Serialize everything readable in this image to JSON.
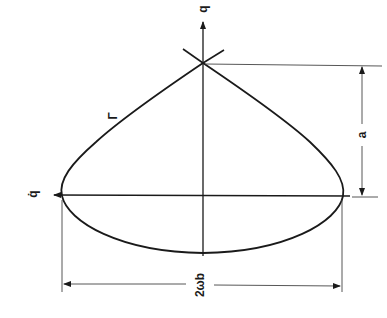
{
  "diagram": {
    "type": "phase-plane trajectory (rotated 90°)",
    "labels": {
      "vertical_axis": "q",
      "horizontal_axis": "q̇",
      "curve": "Γ",
      "height_dimension": "a",
      "width_dimension": "2ωb"
    },
    "colors": {
      "line": "#1a1a1a",
      "thin_line": "#444444",
      "background": "#ffffff"
    }
  }
}
